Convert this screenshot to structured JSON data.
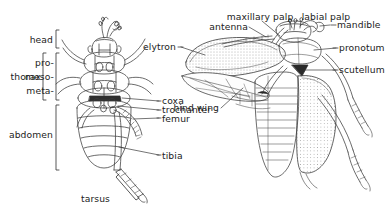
{
  "figure": {
    "background_color": "#ffffff",
    "ink_color": "#3a3a3a",
    "text_color": "#222222"
  },
  "brackets": [
    {
      "id": "head",
      "label": "head"
    },
    {
      "id": "thorax",
      "label": "thorax"
    },
    {
      "id": "abdomen",
      "label": "abdomen"
    },
    {
      "id": "tarsus",
      "label": "tarsus"
    }
  ],
  "thorax_subparts": [
    {
      "id": "pro",
      "label": "pro-"
    },
    {
      "id": "meso",
      "label": "meso-"
    },
    {
      "id": "meta",
      "label": "meta-"
    }
  ],
  "labels_left": [
    {
      "id": "head",
      "label": "head"
    },
    {
      "id": "thorax",
      "label": "thorax"
    },
    {
      "id": "pro",
      "label": "pro-"
    },
    {
      "id": "meso",
      "label": "meso-"
    },
    {
      "id": "meta",
      "label": "meta-"
    },
    {
      "id": "abdomen",
      "label": "abdomen"
    },
    {
      "id": "coxa",
      "label": "coxa"
    },
    {
      "id": "trochanter",
      "label": "trochanter"
    },
    {
      "id": "femur",
      "label": "femur"
    },
    {
      "id": "tibia",
      "label": "tibia"
    },
    {
      "id": "tarsus",
      "label": "tarsus"
    },
    {
      "id": "elytron",
      "label": "elytron"
    }
  ],
  "labels_right": [
    {
      "id": "maxillary-palp",
      "label": "maxillary palp"
    },
    {
      "id": "labial-palp",
      "label": "labial palp"
    },
    {
      "id": "antenna",
      "label": "antenna"
    },
    {
      "id": "mandible",
      "label": "mandible"
    },
    {
      "id": "pronotum",
      "label": "pronotum"
    },
    {
      "id": "scutellum",
      "label": "scutellum"
    },
    {
      "id": "hind-wing",
      "label": "hind wing"
    }
  ],
  "all_labels": {
    "head": "head",
    "thorax": "thorax",
    "pro": "pro-",
    "meso": "meso-",
    "meta": "meta-",
    "abdomen": "abdomen",
    "coxa": "coxa",
    "trochanter": "trochanter",
    "femur": "femur",
    "tibia": "tibia",
    "tarsus": "tarsus",
    "elytron": "elytron",
    "maxillary_palp": "maxillary palp",
    "labial_palp": "labial palp",
    "antenna": "antenna",
    "mandible": "mandible",
    "pronotum": "pronotum",
    "scutellum": "scutellum",
    "hind_wing": "hind wing"
  }
}
